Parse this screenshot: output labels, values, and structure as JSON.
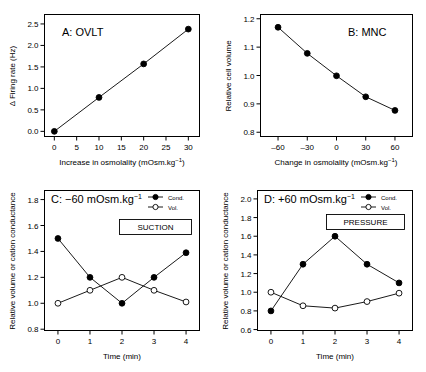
{
  "figure": {
    "name": "four-panel-osmolality-figure",
    "background": "#ffffff",
    "line_color": "#000000"
  },
  "chart_data": [
    {
      "panel": "A",
      "type": "line",
      "title": "A:  OVLT",
      "xlabel": "Increase in osmolality (mOsm.kg⁻¹)",
      "ylabel": "Δ Firing rate (Hz)",
      "xlim": [
        -2.2,
        32.5
      ],
      "ylim": [
        -0.12,
        2.72
      ],
      "xticks": [
        0,
        5,
        10,
        15,
        20,
        25,
        30
      ],
      "xtick_labels": [
        "0",
        "5",
        "10",
        "15",
        "20",
        "25",
        "30"
      ],
      "yticks": [
        0.0,
        0.5,
        1.0,
        1.5,
        2.0,
        2.5
      ],
      "ytick_labels": [
        "0.0",
        "0.5",
        "1.0",
        "1.5",
        "2.0",
        "2.5"
      ],
      "grid": false,
      "legend": false,
      "series": [
        {
          "name": "firing-rate",
          "marker": "filled-circle",
          "x": [
            0,
            10,
            20,
            30
          ],
          "values": [
            0.0,
            0.79,
            1.57,
            2.38
          ]
        }
      ]
    },
    {
      "panel": "B",
      "type": "line",
      "title": "B:  MNC",
      "xlabel": "Change in osmolality (mOsm.kg⁻¹)",
      "ylabel": "Relative cell volume",
      "xlim": [
        -78,
        78
      ],
      "ylim": [
        0.785,
        1.215
      ],
      "xticks": [
        -60,
        -30,
        0,
        30,
        60
      ],
      "xtick_labels": [
        "–60",
        "–30",
        "0",
        "30",
        "60"
      ],
      "yticks": [
        0.8,
        0.9,
        1.0,
        1.1,
        1.2
      ],
      "ytick_labels": [
        "0.8",
        "0.9",
        "1.0",
        "1.1",
        "1.2"
      ],
      "grid": false,
      "legend": false,
      "series": [
        {
          "name": "relative-cell-volume",
          "marker": "filled-circle",
          "x": [
            -60,
            -30,
            0,
            30,
            60
          ],
          "values": [
            1.17,
            1.078,
            0.999,
            0.925,
            0.877
          ]
        }
      ]
    },
    {
      "panel": "C",
      "type": "line",
      "title": "C: –60 mOsm.kg⁻¹",
      "xlabel": "Time (min)",
      "ylabel": "Relative volume or cation conductance",
      "annotation": "SUCTION",
      "xlim": [
        -0.42,
        4.42
      ],
      "ylim": [
        0.79,
        1.87
      ],
      "xticks": [
        0,
        1,
        2,
        3,
        4
      ],
      "xtick_labels": [
        "0",
        "1",
        "2",
        "3",
        "4"
      ],
      "yticks": [
        0.8,
        1.0,
        1.2,
        1.4,
        1.6,
        1.8
      ],
      "ytick_labels": [
        "0.8",
        "1.0",
        "1.2",
        "1.4",
        "1.6",
        "1.8"
      ],
      "grid": false,
      "legend": true,
      "legend_position": "top-right",
      "series": [
        {
          "name": "Cond.",
          "marker": "filled-circle",
          "x": [
            0,
            1,
            2,
            3,
            4
          ],
          "values": [
            1.5,
            1.2,
            1.0,
            1.2,
            1.39
          ]
        },
        {
          "name": "Vol.",
          "marker": "open-circle",
          "x": [
            0,
            1,
            2,
            3,
            4
          ],
          "values": [
            1.0,
            1.1,
            1.2,
            1.1,
            1.01
          ]
        }
      ]
    },
    {
      "panel": "D",
      "type": "line",
      "title": "D: +60 mOsm.kg⁻¹",
      "xlabel": "Time (min)",
      "ylabel": "Relative volume or cation conductance",
      "annotation": "PRESSURE",
      "xlim": [
        -0.42,
        4.42
      ],
      "ylim": [
        0.59,
        2.09
      ],
      "xticks": [
        0,
        1,
        2,
        3,
        4
      ],
      "xtick_labels": [
        "0",
        "1",
        "2",
        "3",
        "4"
      ],
      "yticks": [
        0.6,
        0.8,
        1.0,
        1.2,
        1.4,
        1.6,
        1.8,
        2.0
      ],
      "ytick_labels": [
        "0.6",
        "0.8",
        "1.0",
        "1.2",
        "1.4",
        "1.6",
        "1.8",
        "2.0"
      ],
      "grid": false,
      "legend": true,
      "legend_position": "top-right",
      "series": [
        {
          "name": "Cond.",
          "marker": "filled-circle",
          "x": [
            0,
            1,
            2,
            3,
            4
          ],
          "values": [
            0.8,
            1.3,
            1.6,
            1.3,
            1.1
          ]
        },
        {
          "name": "Vol.",
          "marker": "open-circle",
          "x": [
            0,
            1,
            2,
            3,
            4
          ],
          "values": [
            1.0,
            0.855,
            0.83,
            0.9,
            0.99
          ]
        }
      ]
    }
  ]
}
